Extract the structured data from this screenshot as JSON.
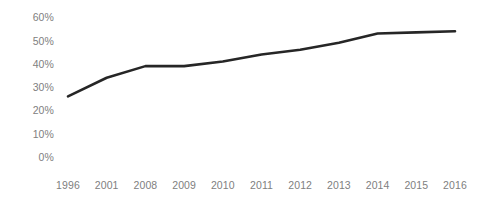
{
  "chart_data": {
    "type": "line",
    "title": "",
    "subtitle": "",
    "xlabel": "",
    "ylabel": "",
    "categories": [
      "1996",
      "2001",
      "2008",
      "2009",
      "2010",
      "2011",
      "2012",
      "2013",
      "2014",
      "2015",
      "2016"
    ],
    "values": [
      26,
      34,
      39,
      39,
      41,
      44,
      46,
      49,
      53,
      53.5,
      54
    ],
    "series": [
      {
        "name": "",
        "values": [
          26,
          34,
          39,
          39,
          41,
          44,
          46,
          49,
          53,
          53.5,
          54
        ]
      }
    ],
    "y_ticks": [
      "0%",
      "10%",
      "20%",
      "30%",
      "40%",
      "50%",
      "60%"
    ],
    "y_tick_values": [
      0,
      10,
      20,
      30,
      40,
      50,
      60
    ],
    "ylim": [
      0,
      60
    ],
    "value_suffix": "%",
    "grid": false,
    "legend": "none",
    "line_color": "#262626",
    "line_width": 2.6,
    "markers": false,
    "axis_text_color": "#808080",
    "background_color": "#ffffff"
  },
  "layout": {
    "plot_left": 68,
    "plot_right": 455,
    "zero_y": 157,
    "pixels_per_ten_percent": 23.3,
    "x_axis_row_y": 180
  }
}
